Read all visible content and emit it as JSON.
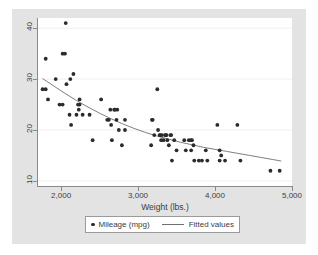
{
  "chart_data": {
    "type": "scatter",
    "title": "",
    "xlabel": "Weight (lbs.)",
    "ylabel": "",
    "xlim": [
      1700,
      5000
    ],
    "ylim": [
      9,
      42
    ],
    "xticks": [
      2000,
      3000,
      4000,
      5000
    ],
    "xtick_labels": [
      "2,000",
      "3,000",
      "4,000",
      "5,000"
    ],
    "yticks": [
      10,
      20,
      30,
      40
    ],
    "ytick_labels": [
      "10",
      "20",
      "30",
      "40"
    ],
    "grid": "horizontal",
    "legend_position": "bottom",
    "series": [
      {
        "name": "Mileage (mpg)",
        "type": "scatter",
        "marker": "circle",
        "color": "#2b2b2b",
        "points": [
          [
            1760,
            28
          ],
          [
            1800,
            28
          ],
          [
            1800,
            34
          ],
          [
            1830,
            26
          ],
          [
            1930,
            30
          ],
          [
            1980,
            25
          ],
          [
            2020,
            25
          ],
          [
            2020,
            35
          ],
          [
            2050,
            35
          ],
          [
            2060,
            41
          ],
          [
            2070,
            29
          ],
          [
            2110,
            23
          ],
          [
            2120,
            30
          ],
          [
            2130,
            21
          ],
          [
            2160,
            31
          ],
          [
            2200,
            23
          ],
          [
            2220,
            25
          ],
          [
            2230,
            24
          ],
          [
            2240,
            26
          ],
          [
            2240,
            25
          ],
          [
            2280,
            23
          ],
          [
            2370,
            23
          ],
          [
            2410,
            18
          ],
          [
            2520,
            26
          ],
          [
            2600,
            22
          ],
          [
            2620,
            22
          ],
          [
            2640,
            24
          ],
          [
            2650,
            21
          ],
          [
            2660,
            18
          ],
          [
            2690,
            24
          ],
          [
            2700,
            24
          ],
          [
            2720,
            22
          ],
          [
            2730,
            24
          ],
          [
            2750,
            20
          ],
          [
            2790,
            17
          ],
          [
            2830,
            22
          ],
          [
            2830,
            20
          ],
          [
            3170,
            17
          ],
          [
            3180,
            22
          ],
          [
            3190,
            22
          ],
          [
            3210,
            19
          ],
          [
            3250,
            28
          ],
          [
            3260,
            20
          ],
          [
            3280,
            19
          ],
          [
            3290,
            19
          ],
          [
            3300,
            18
          ],
          [
            3310,
            19
          ],
          [
            3330,
            18
          ],
          [
            3350,
            19
          ],
          [
            3360,
            19
          ],
          [
            3370,
            19
          ],
          [
            3380,
            18
          ],
          [
            3400,
            17
          ],
          [
            3420,
            19
          ],
          [
            3430,
            19
          ],
          [
            3440,
            14
          ],
          [
            3470,
            18
          ],
          [
            3500,
            16
          ],
          [
            3600,
            18
          ],
          [
            3620,
            16
          ],
          [
            3660,
            18
          ],
          [
            3690,
            18
          ],
          [
            3690,
            16
          ],
          [
            3700,
            18
          ],
          [
            3720,
            17
          ],
          [
            3730,
            14
          ],
          [
            3790,
            14
          ],
          [
            3830,
            14
          ],
          [
            3880,
            16
          ],
          [
            3900,
            14
          ],
          [
            4030,
            21
          ],
          [
            4060,
            16
          ],
          [
            4080,
            15
          ],
          [
            4060,
            14
          ],
          [
            4130,
            14
          ],
          [
            4290,
            21
          ],
          [
            4330,
            14
          ],
          [
            4720,
            12
          ],
          [
            4840,
            12
          ]
        ]
      },
      {
        "name": "Fitted values",
        "type": "line",
        "color": "#6f6f6f",
        "points": [
          [
            1760,
            30.1
          ],
          [
            1900,
            28.7
          ],
          [
            2050,
            27.2
          ],
          [
            2200,
            25.8
          ],
          [
            2350,
            24.5
          ],
          [
            2500,
            23.3
          ],
          [
            2650,
            22.2
          ],
          [
            2800,
            21.2
          ],
          [
            2950,
            20.3
          ],
          [
            3100,
            19.5
          ],
          [
            3250,
            18.8
          ],
          [
            3400,
            18.2
          ],
          [
            3550,
            17.6
          ],
          [
            3700,
            17.1
          ],
          [
            3850,
            16.6
          ],
          [
            4000,
            16.2
          ],
          [
            4150,
            15.8
          ],
          [
            4300,
            15.4
          ],
          [
            4450,
            15.0
          ],
          [
            4600,
            14.6
          ],
          [
            4750,
            14.2
          ],
          [
            4860,
            13.9
          ]
        ]
      }
    ],
    "legend": [
      {
        "label": "Mileage (mpg)",
        "marker": "circle"
      },
      {
        "label": "Fitted values",
        "marker": "line"
      }
    ],
    "colors": {
      "background": "#e3e3e3",
      "plot_background": "#ffffff",
      "marker": "#2b2b2b",
      "fit_line": "#6f6f6f",
      "axis": "#8a8a8a",
      "gridline": "#f0f0f0",
      "text": "#3c3c3c"
    }
  }
}
